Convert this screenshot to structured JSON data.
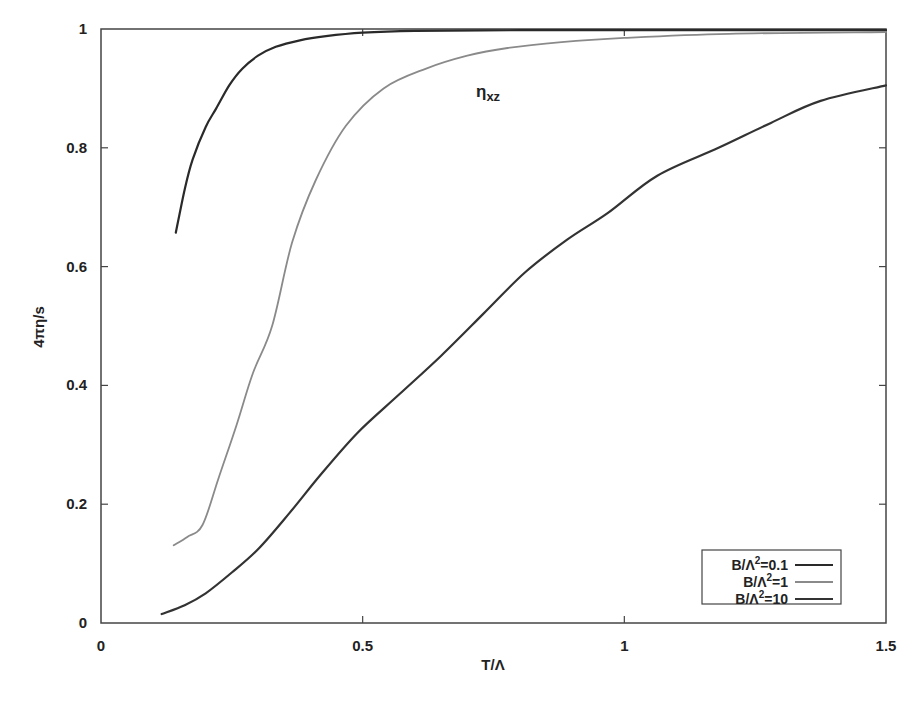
{
  "chart_data": {
    "type": "line",
    "title": "",
    "annotation": {
      "text": "η",
      "subscript": "xz",
      "x": 0.72,
      "y": 0.92
    },
    "xlabel": "T/Λ",
    "ylabel": "4πη/s",
    "xlim": [
      0,
      1.5
    ],
    "ylim": [
      0,
      1
    ],
    "xticks": [
      0,
      0.5,
      1,
      1.5
    ],
    "xtick_labels": [
      "0",
      "0.5",
      "1",
      "1.5"
    ],
    "yticks": [
      0,
      0.2,
      0.4,
      0.6,
      0.8,
      1
    ],
    "ytick_labels": [
      "0",
      "0.2",
      "0.4",
      "0.6",
      "0.8",
      "1"
    ],
    "grid": false,
    "legend_position": "lower right",
    "series": [
      {
        "name": "B/Λ²=0.1",
        "label_base": "B/Λ",
        "label_sup": "2",
        "label_tail": "=0.1",
        "color": "#2a2a2a",
        "width": 2.2,
        "x": [
          0.143,
          0.16,
          0.175,
          0.2,
          0.22,
          0.245,
          0.27,
          0.3,
          0.334,
          0.38,
          0.43,
          0.5,
          0.6,
          0.8,
          1.0,
          1.2,
          1.5
        ],
        "y": [
          0.657,
          0.73,
          0.78,
          0.835,
          0.866,
          0.905,
          0.933,
          0.955,
          0.97,
          0.981,
          0.988,
          0.994,
          0.997,
          0.998,
          0.998,
          0.998,
          0.998
        ]
      },
      {
        "name": "B/Λ²=1",
        "label_base": "B/Λ",
        "label_sup": "2",
        "label_tail": "=1",
        "color": "#8a8a8a",
        "width": 1.8,
        "x": [
          0.139,
          0.165,
          0.194,
          0.225,
          0.259,
          0.29,
          0.327,
          0.365,
          0.41,
          0.468,
          0.54,
          0.62,
          0.7,
          0.777,
          0.88,
          1.0,
          1.2,
          1.5
        ],
        "y": [
          0.131,
          0.145,
          0.165,
          0.245,
          0.333,
          0.42,
          0.5,
          0.64,
          0.745,
          0.837,
          0.9,
          0.933,
          0.955,
          0.968,
          0.978,
          0.985,
          0.992,
          0.995
        ]
      },
      {
        "name": "B/Λ²=10",
        "label_base": "B/Λ",
        "label_sup": "2",
        "label_tail": "=10",
        "color": "#333333",
        "width": 2.2,
        "x": [
          0.116,
          0.16,
          0.2,
          0.25,
          0.302,
          0.36,
          0.42,
          0.49,
          0.57,
          0.65,
          0.73,
          0.81,
          0.89,
          0.968,
          1.063,
          1.18,
          1.28,
          1.375,
          1.5
        ],
        "y": [
          0.015,
          0.03,
          0.05,
          0.085,
          0.126,
          0.185,
          0.25,
          0.32,
          0.385,
          0.45,
          0.52,
          0.59,
          0.645,
          0.69,
          0.753,
          0.8,
          0.842,
          0.879,
          0.905
        ]
      }
    ]
  }
}
